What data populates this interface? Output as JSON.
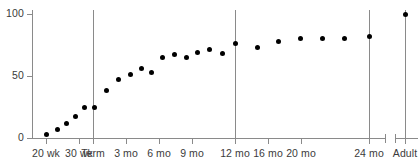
{
  "chart_data": {
    "type": "scatter",
    "title": "",
    "subtitle": "",
    "xlabel": "",
    "ylabel": "",
    "ylim": [
      0,
      110
    ],
    "yticks": [
      0,
      50,
      100
    ],
    "ytick_labels": [
      "0",
      "50",
      "100"
    ],
    "grid": false,
    "legend": null,
    "xtick_labels": [
      "20 wk",
      "30 wk",
      "Term",
      "3 mo",
      "6 mo",
      "9 mo",
      "12 mo",
      "16 mo",
      "20 mo",
      "24 mo",
      "Adult"
    ],
    "xtick_positions_px": [
      46,
      79,
      93,
      126,
      159,
      192,
      235,
      268,
      301,
      369,
      405
    ],
    "axis_break": {
      "present": true,
      "between": [
        "24 mo",
        "Adult"
      ],
      "x_px": [
        385,
        395
      ]
    },
    "reference_lines": [
      {
        "label": "Term",
        "x_px": 93
      },
      {
        "label": "12 mo",
        "x_px": 235
      },
      {
        "label": "24 mo",
        "x_px": 369
      },
      {
        "label": "Adult",
        "x_px": 405
      }
    ],
    "point_color": "#000000",
    "axis_color": "#8a8a8a",
    "series": [
      {
        "name": "value",
        "points": [
          {
            "x_label": "20 wk",
            "x_px": 46,
            "value": 3
          },
          {
            "x_label": "22 wk",
            "x_px": 57,
            "value": 7
          },
          {
            "x_label": "26 wk",
            "x_px": 66,
            "value": 12
          },
          {
            "x_label": "29 wk",
            "x_px": 75,
            "value": 17
          },
          {
            "x_label": "33 wk",
            "x_px": 84,
            "value": 25
          },
          {
            "x_label": "Term",
            "x_px": 94,
            "value": 25
          },
          {
            "x_label": "1 mo",
            "x_px": 106,
            "value": 38
          },
          {
            "x_label": "2 mo",
            "x_px": 118,
            "value": 47
          },
          {
            "x_label": "3 mo",
            "x_px": 130,
            "value": 51
          },
          {
            "x_label": "4 mo",
            "x_px": 141,
            "value": 56
          },
          {
            "x_label": "5 mo",
            "x_px": 151,
            "value": 53
          },
          {
            "x_label": "6 mo",
            "x_px": 162,
            "value": 65
          },
          {
            "x_label": "7 mo",
            "x_px": 174,
            "value": 67
          },
          {
            "x_label": "8 mo",
            "x_px": 186,
            "value": 65
          },
          {
            "x_label": "9 mo",
            "x_px": 197,
            "value": 69
          },
          {
            "x_label": "10 mo",
            "x_px": 209,
            "value": 71
          },
          {
            "x_label": "11 mo",
            "x_px": 222,
            "value": 68
          },
          {
            "x_label": "12 mo",
            "x_px": 235,
            "value": 76
          },
          {
            "x_label": "14 mo",
            "x_px": 257,
            "value": 73
          },
          {
            "x_label": "16 mo",
            "x_px": 278,
            "value": 78
          },
          {
            "x_label": "18 mo",
            "x_px": 300,
            "value": 80
          },
          {
            "x_label": "20 mo",
            "x_px": 322,
            "value": 80
          },
          {
            "x_label": "22 mo",
            "x_px": 344,
            "value": 80
          },
          {
            "x_label": "24 mo",
            "x_px": 369,
            "value": 82
          },
          {
            "x_label": "Adult",
            "x_px": 405,
            "value": 100
          }
        ]
      }
    ]
  },
  "axes": {
    "y_axis_x_px": 32,
    "x_axis_y_px": 138,
    "y_top_px": 10,
    "x_right_px": 418
  }
}
